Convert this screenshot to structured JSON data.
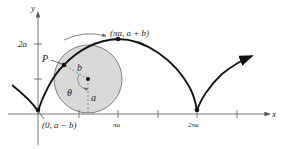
{
  "figure": {
    "type": "prolate cycloid diagram",
    "axes": {
      "x_label": "x",
      "y_label": "y",
      "y_ticks": [
        {
          "label": "2a"
        }
      ],
      "x_ticks": [
        {
          "label": "πa"
        },
        {
          "label": "2πa"
        }
      ]
    },
    "points": {
      "P": {
        "label": "P"
      },
      "top": {
        "label": "(πa, a + b)"
      },
      "start": {
        "label": "(0, a − b)"
      }
    },
    "circle": {
      "radius_label": "a",
      "arm_label": "b",
      "angle_label": "θ"
    },
    "colors": {
      "curve": "#111111",
      "circle_fill": "#d9d9d9",
      "circle_stroke": "#555555",
      "axis": "#555555"
    }
  }
}
